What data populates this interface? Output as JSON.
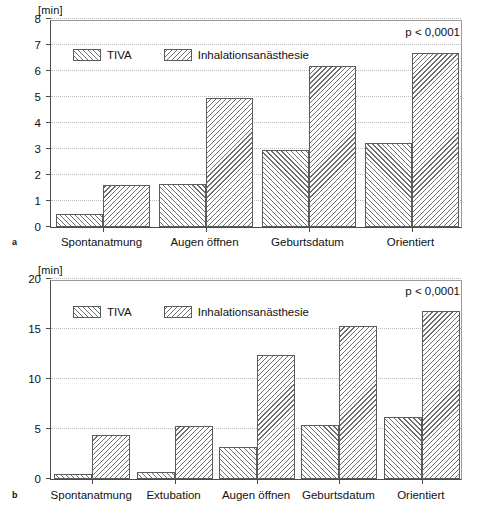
{
  "figure": {
    "unit_label": "[min]",
    "significance": "p < 0,0001",
    "panel_a_letter": "a",
    "panel_b_letter": "b",
    "series_names": [
      "TIVA",
      "Inhalationsanästhesie"
    ]
  },
  "legend": {
    "tiva_label": "TIVA",
    "inhal_label": "Inhalationsanästhesie",
    "tiva_swatch": "forward-hatch",
    "inhal_swatch": "backward-hatch"
  },
  "chart_data": [
    {
      "id": "panel-a",
      "type": "bar",
      "title": "",
      "panel": "a",
      "xlabel": "",
      "ylabel": "[min]",
      "ylim": [
        0,
        8
      ],
      "yticks": [
        0,
        1,
        2,
        3,
        4,
        5,
        6,
        7,
        8
      ],
      "ytick_labels": [
        "0",
        "1",
        "2",
        "3",
        "4",
        "5",
        "6",
        "7",
        "8"
      ],
      "grid": true,
      "legend_position": "upper-left-inside",
      "annotation": "p < 0,0001",
      "categories": [
        "Spontanatmung",
        "Augen öffnen",
        "Geburtsdatum",
        "Orientiert"
      ],
      "series": [
        {
          "name": "TIVA",
          "hatch": "forward",
          "values": [
            0.5,
            1.65,
            2.95,
            3.25
          ]
        },
        {
          "name": "Inhalationsanästhesie",
          "hatch": "backward",
          "values": [
            1.6,
            4.95,
            6.2,
            6.7
          ]
        }
      ]
    },
    {
      "id": "panel-b",
      "type": "bar",
      "title": "",
      "panel": "b",
      "xlabel": "",
      "ylabel": "[min]",
      "ylim": [
        0,
        20
      ],
      "yticks": [
        0,
        5,
        10,
        15,
        20
      ],
      "ytick_labels": [
        "0",
        "5",
        "10",
        "15",
        "20"
      ],
      "grid": true,
      "legend_position": "upper-left-inside",
      "annotation": "p < 0,0001",
      "categories": [
        "Spontanatmung",
        "Extubation",
        "Augen öffnen",
        "Geburtsdatum",
        "Orientiert"
      ],
      "series": [
        {
          "name": "TIVA",
          "hatch": "forward",
          "values": [
            0.55,
            0.7,
            3.2,
            5.4,
            6.2
          ]
        },
        {
          "name": "Inhalationsanästhesie",
          "hatch": "backward",
          "values": [
            4.4,
            5.3,
            12.4,
            15.3,
            16.8
          ]
        }
      ]
    }
  ],
  "colors": {
    "axis": "#4a4a4a",
    "grid": "#cfcfcf",
    "bar_outline": "#5c5c5c",
    "hatch": "#6e6e6e",
    "background": "#ffffff",
    "text": "#111111"
  }
}
